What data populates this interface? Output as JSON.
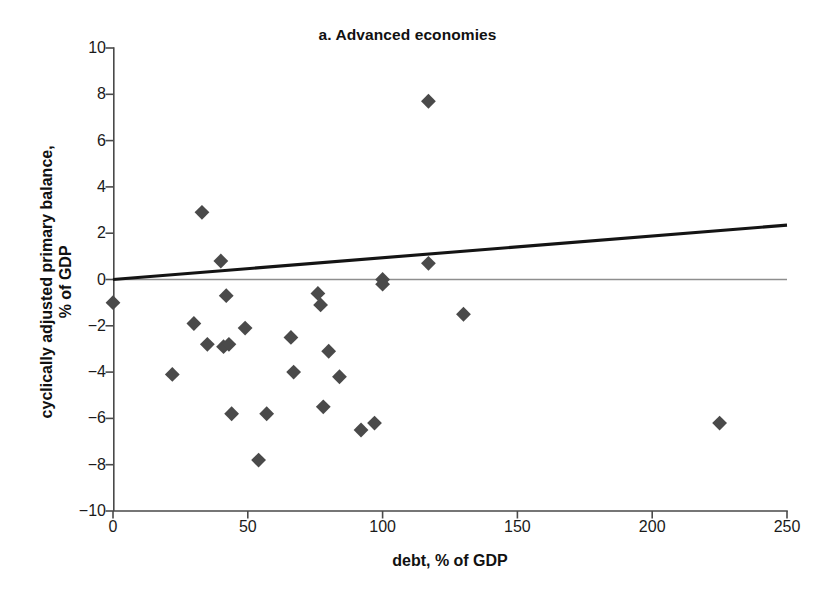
{
  "chart_data": {
    "type": "scatter",
    "title": "a. Advanced economies",
    "xlabel": "debt, % of GDP",
    "ylabel": "cyclically adjusted primary balance, % of GDP",
    "ylabel_line1": "cyclically adjusted primary balance,",
    "ylabel_line2": "% of GDP",
    "xlim": [
      0,
      250
    ],
    "ylim": [
      -10,
      10
    ],
    "xticks": [
      0,
      50,
      100,
      150,
      200,
      250
    ],
    "yticks": [
      -10,
      -8,
      -6,
      -4,
      -2,
      0,
      2,
      4,
      6,
      8,
      10
    ],
    "grid": false,
    "legend": "none",
    "marker": "diamond",
    "marker_color": "#4a4a4a",
    "zero_line": {
      "y": 0,
      "color": "#8e8e8e"
    },
    "series": [
      {
        "name": "advanced economies",
        "points": [
          {
            "x": 0,
            "y": -1.0
          },
          {
            "x": 22,
            "y": -4.1
          },
          {
            "x": 30,
            "y": -1.9
          },
          {
            "x": 33,
            "y": 2.9
          },
          {
            "x": 35,
            "y": -2.8
          },
          {
            "x": 40,
            "y": 0.8
          },
          {
            "x": 41,
            "y": -2.9
          },
          {
            "x": 43,
            "y": -2.8
          },
          {
            "x": 42,
            "y": -0.7
          },
          {
            "x": 44,
            "y": -5.8
          },
          {
            "x": 49,
            "y": -2.1
          },
          {
            "x": 54,
            "y": -7.8
          },
          {
            "x": 57,
            "y": -5.8
          },
          {
            "x": 66,
            "y": -2.5
          },
          {
            "x": 67,
            "y": -4.0
          },
          {
            "x": 76,
            "y": -0.6
          },
          {
            "x": 77,
            "y": -1.1
          },
          {
            "x": 78,
            "y": -5.5
          },
          {
            "x": 80,
            "y": -3.1
          },
          {
            "x": 84,
            "y": -4.2
          },
          {
            "x": 92,
            "y": -6.5
          },
          {
            "x": 97,
            "y": -6.2
          },
          {
            "x": 100,
            "y": 0.0
          },
          {
            "x": 100,
            "y": -0.2
          },
          {
            "x": 117,
            "y": 7.7
          },
          {
            "x": 117,
            "y": 0.7
          },
          {
            "x": 130,
            "y": -1.5
          },
          {
            "x": 225,
            "y": -6.2
          }
        ]
      }
    ],
    "trendline": {
      "name": "linear fit",
      "color": "#141414",
      "x_start": 0,
      "y_start": 0.0,
      "x_end": 250,
      "y_end": 2.35
    }
  }
}
